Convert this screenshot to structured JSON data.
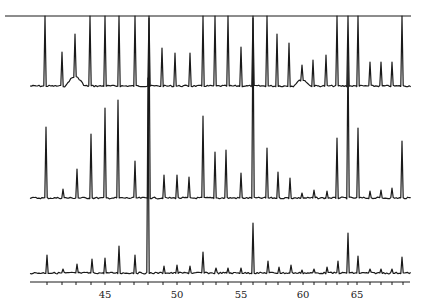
{
  "chart_data": {
    "type": "line",
    "title": "",
    "xlabel": "",
    "ylabel": "",
    "grid": false,
    "legend": null,
    "x_axis": {
      "tick_labels": [
        "45",
        "50",
        "55",
        "60",
        "65"
      ],
      "tick_label_px": [
        105,
        177,
        241,
        303,
        357
      ],
      "minor_tick_px": [
        47,
        62,
        76,
        91,
        105,
        120,
        134,
        148,
        163,
        177,
        190,
        203,
        216,
        228,
        241,
        253,
        266,
        278,
        290,
        303,
        314,
        326,
        337,
        348,
        357,
        370,
        381,
        392,
        403
      ],
      "px_range": [
        30,
        410
      ],
      "y_px": 282
    },
    "top_line": {
      "x_px": [
        5,
        411
      ],
      "y_px": 16
    },
    "series": [
      {
        "name": "trace-top",
        "baseline_px": 86,
        "clip_top_px": 16,
        "broad_bumps": [
          {
            "x_px": 75,
            "height_px": 9,
            "width_px": 18
          },
          {
            "x_px": 302,
            "height_px": 6,
            "width_px": 16
          }
        ],
        "peaks": [
          {
            "x_px": 45,
            "height_px": 70
          },
          {
            "x_px": 62,
            "height_px": 34
          },
          {
            "x_px": 75,
            "height_px": 52
          },
          {
            "x_px": 90,
            "height_px": 70
          },
          {
            "x_px": 105,
            "height_px": 70
          },
          {
            "x_px": 119,
            "height_px": 70
          },
          {
            "x_px": 135,
            "height_px": 70
          },
          {
            "x_px": 149,
            "height_px": 70
          },
          {
            "x_px": 162,
            "height_px": 38
          },
          {
            "x_px": 175,
            "height_px": 33
          },
          {
            "x_px": 190,
            "height_px": 33
          },
          {
            "x_px": 203,
            "height_px": 70
          },
          {
            "x_px": 215,
            "height_px": 70
          },
          {
            "x_px": 228,
            "height_px": 70
          },
          {
            "x_px": 241,
            "height_px": 39
          },
          {
            "x_px": 253,
            "height_px": 70
          },
          {
            "x_px": 267,
            "height_px": 70
          },
          {
            "x_px": 277,
            "height_px": 52
          },
          {
            "x_px": 289,
            "height_px": 43
          },
          {
            "x_px": 302,
            "height_px": 21
          },
          {
            "x_px": 313,
            "height_px": 26
          },
          {
            "x_px": 326,
            "height_px": 31
          },
          {
            "x_px": 337,
            "height_px": 70
          },
          {
            "x_px": 348,
            "height_px": 70
          },
          {
            "x_px": 358,
            "height_px": 70
          },
          {
            "x_px": 370,
            "height_px": 24
          },
          {
            "x_px": 381,
            "height_px": 24
          },
          {
            "x_px": 392,
            "height_px": 24
          },
          {
            "x_px": 402,
            "height_px": 70
          }
        ]
      },
      {
        "name": "trace-middle",
        "baseline_px": 198,
        "clip_top_px": 16,
        "broad_bumps": [],
        "peaks": [
          {
            "x_px": 46,
            "height_px": 71
          },
          {
            "x_px": 63,
            "height_px": 9
          },
          {
            "x_px": 77,
            "height_px": 29
          },
          {
            "x_px": 91,
            "height_px": 64
          },
          {
            "x_px": 105,
            "height_px": 90
          },
          {
            "x_px": 118,
            "height_px": 98
          },
          {
            "x_px": 135,
            "height_px": 37
          },
          {
            "x_px": 149,
            "height_px": 180
          },
          {
            "x_px": 164,
            "height_px": 23
          },
          {
            "x_px": 177,
            "height_px": 23
          },
          {
            "x_px": 189,
            "height_px": 21
          },
          {
            "x_px": 203,
            "height_px": 82
          },
          {
            "x_px": 215,
            "height_px": 46
          },
          {
            "x_px": 226,
            "height_px": 48
          },
          {
            "x_px": 241,
            "height_px": 25
          },
          {
            "x_px": 253,
            "height_px": 180
          },
          {
            "x_px": 267,
            "height_px": 50
          },
          {
            "x_px": 278,
            "height_px": 26
          },
          {
            "x_px": 290,
            "height_px": 20
          },
          {
            "x_px": 302,
            "height_px": 5
          },
          {
            "x_px": 314,
            "height_px": 8
          },
          {
            "x_px": 327,
            "height_px": 7
          },
          {
            "x_px": 337,
            "height_px": 60
          },
          {
            "x_px": 348,
            "height_px": 150
          },
          {
            "x_px": 358,
            "height_px": 70
          },
          {
            "x_px": 370,
            "height_px": 7
          },
          {
            "x_px": 381,
            "height_px": 8
          },
          {
            "x_px": 392,
            "height_px": 10
          },
          {
            "x_px": 402,
            "height_px": 57
          }
        ]
      },
      {
        "name": "trace-bottom",
        "baseline_px": 273,
        "clip_top_px": 16,
        "broad_bumps": [],
        "peaks": [
          {
            "x_px": 47,
            "height_px": 18
          },
          {
            "x_px": 63,
            "height_px": 4
          },
          {
            "x_px": 77,
            "height_px": 9
          },
          {
            "x_px": 92,
            "height_px": 14
          },
          {
            "x_px": 105,
            "height_px": 15
          },
          {
            "x_px": 119,
            "height_px": 27
          },
          {
            "x_px": 135,
            "height_px": 18
          },
          {
            "x_px": 148,
            "height_px": 195
          },
          {
            "x_px": 164,
            "height_px": 7
          },
          {
            "x_px": 177,
            "height_px": 8
          },
          {
            "x_px": 190,
            "height_px": 7
          },
          {
            "x_px": 203,
            "height_px": 21
          },
          {
            "x_px": 216,
            "height_px": 5
          },
          {
            "x_px": 228,
            "height_px": 5
          },
          {
            "x_px": 241,
            "height_px": 5
          },
          {
            "x_px": 253,
            "height_px": 50
          },
          {
            "x_px": 268,
            "height_px": 12
          },
          {
            "x_px": 279,
            "height_px": 6
          },
          {
            "x_px": 291,
            "height_px": 8
          },
          {
            "x_px": 302,
            "height_px": 3
          },
          {
            "x_px": 314,
            "height_px": 4
          },
          {
            "x_px": 327,
            "height_px": 6
          },
          {
            "x_px": 338,
            "height_px": 12
          },
          {
            "x_px": 348,
            "height_px": 40
          },
          {
            "x_px": 358,
            "height_px": 17
          },
          {
            "x_px": 370,
            "height_px": 4
          },
          {
            "x_px": 381,
            "height_px": 4
          },
          {
            "x_px": 392,
            "height_px": 4
          },
          {
            "x_px": 402,
            "height_px": 16
          }
        ]
      }
    ],
    "colors": {
      "ink": "#1a1a1a",
      "background": "#ffffff"
    }
  }
}
